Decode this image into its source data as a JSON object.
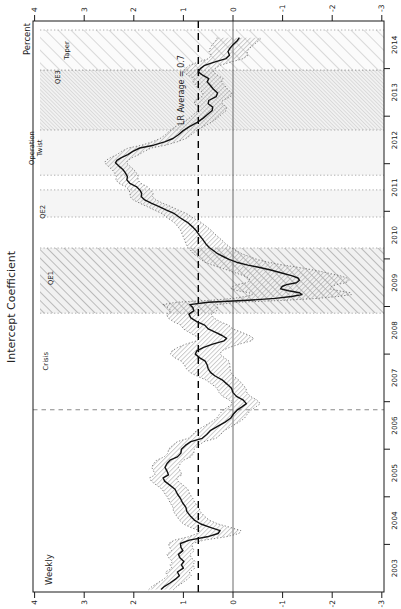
{
  "colors": {
    "line": "#111111",
    "band_edge": "#5f5f5f",
    "band_hatch": "#a0a0a0",
    "zero_line": "#444444",
    "lr_line": "#000000",
    "break_line": "#8a8a8a",
    "frame": "#1a1a1a",
    "text": "#222222",
    "event_edge": "#9a9a9a",
    "qe1_bg": "#f1f1f1",
    "qe1_hatch": "#adadad",
    "qe3_bg": "#f2f2f2",
    "qe3_hatch": "#cbcbcb",
    "taper_bg": "#fbfbfb",
    "taper_hatch": "#c9c9c9",
    "plain_bg": "#f5f5f5"
  },
  "chart_data": {
    "type": "line",
    "title": "Intercept Coefficient",
    "frequency_note": "Weekly",
    "ylabel": "Percent",
    "ylim": [
      -3,
      4
    ],
    "yticks": [
      4,
      3,
      2,
      1,
      0,
      -1,
      -2,
      -3
    ],
    "xlim": [
      2003,
      2015
    ],
    "xtick_years": [
      "2003",
      "2004",
      "2005",
      "2006",
      "2007",
      "2008",
      "2009",
      "2010",
      "2011",
      "2012",
      "2013",
      "2014"
    ],
    "zero_line": 0,
    "lr_average": {
      "value": 0.7,
      "label": "LR Average = 0.7",
      "label_t": 2013.55,
      "label_level": 1.05
    },
    "break_line_t": 2006.83,
    "legend_note": "solid line = posterior mean; dotted hatched band = credible interval",
    "events": [
      {
        "id": "crisis",
        "label": "Crisis",
        "t0": 2006.83,
        "t1": 2008.86,
        "style": "none",
        "label_t": 2007.85,
        "label_depth": 48
      },
      {
        "id": "qe1",
        "label": "QE1",
        "t0": 2008.86,
        "t1": 2010.23,
        "style": "hatch-coarse",
        "label_t": 2009.6,
        "label_depth": 53
      },
      {
        "id": "qe2",
        "label": "QE2",
        "t0": 2010.88,
        "t1": 2011.45,
        "style": "plain",
        "label_t": 2010.99,
        "label_depth": 45
      },
      {
        "id": "twist",
        "label": "Operation Twist",
        "label_lines": [
          "Operation",
          "Twist"
        ],
        "t0": 2011.76,
        "t1": 2012.98,
        "style": "plain",
        "label_t": 2012.33,
        "label_depth": 42
      },
      {
        "id": "qe3",
        "label": "QE3",
        "t0": 2012.71,
        "t1": 2013.97,
        "style": "hatch-fine",
        "label_t": 2013.82,
        "label_depth": 60
      },
      {
        "id": "taper",
        "label": "Taper",
        "t0": 2013.97,
        "t1": 2014.81,
        "style": "hatch-sparse",
        "label_t": 2014.38,
        "label_depth": 69
      }
    ],
    "series": [
      {
        "name": "Intercept coefficient",
        "points": [
          [
            2003.05,
            1.45,
            0.25
          ],
          [
            2003.12,
            1.38,
            0.25
          ],
          [
            2003.19,
            1.27,
            0.25
          ],
          [
            2003.27,
            1.16,
            0.24
          ],
          [
            2003.34,
            1.08,
            0.24
          ],
          [
            2003.42,
            1.12,
            0.24
          ],
          [
            2003.5,
            1.0,
            0.23
          ],
          [
            2003.57,
            1.04,
            0.23
          ],
          [
            2003.64,
            0.99,
            0.23
          ],
          [
            2003.72,
            1.07,
            0.23
          ],
          [
            2003.79,
            1.1,
            0.23
          ],
          [
            2003.87,
            1.01,
            0.23
          ],
          [
            2003.94,
            1.05,
            0.23
          ],
          [
            2004.02,
            1.06,
            0.24
          ],
          [
            2004.09,
            0.88,
            0.3
          ],
          [
            2004.16,
            0.52,
            0.38
          ],
          [
            2004.23,
            0.3,
            0.42
          ],
          [
            2004.29,
            0.26,
            0.42
          ],
          [
            2004.36,
            0.46,
            0.4
          ],
          [
            2004.43,
            0.65,
            0.35
          ],
          [
            2004.51,
            0.78,
            0.3
          ],
          [
            2004.6,
            0.86,
            0.28
          ],
          [
            2004.69,
            0.93,
            0.27
          ],
          [
            2004.78,
            0.95,
            0.26
          ],
          [
            2004.88,
            1.02,
            0.25
          ],
          [
            2004.97,
            1.06,
            0.25
          ],
          [
            2005.06,
            1.12,
            0.25
          ],
          [
            2005.16,
            1.17,
            0.26
          ],
          [
            2005.25,
            1.28,
            0.27
          ],
          [
            2005.33,
            1.38,
            0.27
          ],
          [
            2005.4,
            1.41,
            0.27
          ],
          [
            2005.46,
            1.3,
            0.27
          ],
          [
            2005.54,
            1.33,
            0.27
          ],
          [
            2005.62,
            1.37,
            0.27
          ],
          [
            2005.7,
            1.33,
            0.27
          ],
          [
            2005.77,
            1.27,
            0.27
          ],
          [
            2005.84,
            1.12,
            0.27
          ],
          [
            2005.92,
            1.05,
            0.26
          ],
          [
            2006.0,
            1.04,
            0.26
          ],
          [
            2006.08,
            0.96,
            0.26
          ],
          [
            2006.16,
            0.85,
            0.27
          ],
          [
            2006.23,
            0.62,
            0.28
          ],
          [
            2006.31,
            0.53,
            0.28
          ],
          [
            2006.39,
            0.46,
            0.28
          ],
          [
            2006.48,
            0.31,
            0.28
          ],
          [
            2006.57,
            0.16,
            0.28
          ],
          [
            2006.65,
            0.05,
            0.28
          ],
          [
            2006.74,
            -0.01,
            0.28
          ],
          [
            2006.82,
            -0.08,
            0.28
          ],
          [
            2006.89,
            -0.18,
            0.28
          ],
          [
            2006.96,
            -0.27,
            0.28
          ],
          [
            2007.04,
            -0.2,
            0.28
          ],
          [
            2007.11,
            -0.07,
            0.28
          ],
          [
            2007.19,
            0.0,
            0.28
          ],
          [
            2007.28,
            0.03,
            0.29
          ],
          [
            2007.37,
            0.12,
            0.31
          ],
          [
            2007.46,
            0.22,
            0.33
          ],
          [
            2007.54,
            0.36,
            0.37
          ],
          [
            2007.61,
            0.45,
            0.41
          ],
          [
            2007.69,
            0.5,
            0.44
          ],
          [
            2007.77,
            0.52,
            0.46
          ],
          [
            2007.85,
            0.56,
            0.48
          ],
          [
            2007.92,
            0.67,
            0.5
          ],
          [
            2008.0,
            0.76,
            0.5
          ],
          [
            2008.07,
            0.73,
            0.5
          ],
          [
            2008.14,
            0.59,
            0.52
          ],
          [
            2008.21,
            0.41,
            0.54
          ],
          [
            2008.28,
            0.18,
            0.55
          ],
          [
            2008.33,
            0.13,
            0.55
          ],
          [
            2008.39,
            0.22,
            0.55
          ],
          [
            2008.46,
            0.36,
            0.53
          ],
          [
            2008.53,
            0.5,
            0.5
          ],
          [
            2008.61,
            0.57,
            0.48
          ],
          [
            2008.68,
            0.73,
            0.47
          ],
          [
            2008.76,
            0.85,
            0.46
          ],
          [
            2008.84,
            0.89,
            0.45
          ],
          [
            2008.91,
            0.79,
            0.46
          ],
          [
            2008.98,
            0.81,
            0.5
          ],
          [
            2009.04,
            0.87,
            0.55
          ],
          [
            2009.09,
            0.5,
            0.63
          ],
          [
            2009.13,
            -0.3,
            0.75
          ],
          [
            2009.17,
            -0.85,
            0.85
          ],
          [
            2009.21,
            -1.18,
            0.93
          ],
          [
            2009.25,
            -1.39,
            1.0
          ],
          [
            2009.29,
            -1.34,
            1.02
          ],
          [
            2009.33,
            -1.12,
            1.02
          ],
          [
            2009.37,
            -0.96,
            1.0
          ],
          [
            2009.42,
            -0.99,
            1.0
          ],
          [
            2009.46,
            -1.08,
            1.0
          ],
          [
            2009.5,
            -1.28,
            1.0
          ],
          [
            2009.55,
            -1.34,
            1.0
          ],
          [
            2009.6,
            -1.31,
            0.99
          ],
          [
            2009.65,
            -1.18,
            0.97
          ],
          [
            2009.7,
            -1.0,
            0.93
          ],
          [
            2009.76,
            -0.78,
            0.88
          ],
          [
            2009.82,
            -0.54,
            0.8
          ],
          [
            2009.87,
            -0.3,
            0.72
          ],
          [
            2009.93,
            -0.07,
            0.64
          ],
          [
            2009.99,
            0.08,
            0.57
          ],
          [
            2010.05,
            0.2,
            0.52
          ],
          [
            2010.11,
            0.31,
            0.49
          ],
          [
            2010.17,
            0.39,
            0.46
          ],
          [
            2010.24,
            0.48,
            0.43
          ],
          [
            2010.32,
            0.55,
            0.4
          ],
          [
            2010.41,
            0.61,
            0.37
          ],
          [
            2010.5,
            0.68,
            0.34
          ],
          [
            2010.59,
            0.74,
            0.31
          ],
          [
            2010.68,
            0.82,
            0.29
          ],
          [
            2010.77,
            0.92,
            0.27
          ],
          [
            2010.86,
            1.06,
            0.26
          ],
          [
            2010.95,
            1.18,
            0.25
          ],
          [
            2011.03,
            1.35,
            0.24
          ],
          [
            2011.1,
            1.49,
            0.24
          ],
          [
            2011.17,
            1.65,
            0.23
          ],
          [
            2011.24,
            1.78,
            0.23
          ],
          [
            2011.31,
            1.85,
            0.23
          ],
          [
            2011.38,
            1.84,
            0.23
          ],
          [
            2011.45,
            1.88,
            0.22
          ],
          [
            2011.52,
            1.95,
            0.22
          ],
          [
            2011.59,
            2.08,
            0.22
          ],
          [
            2011.66,
            2.14,
            0.22
          ],
          [
            2011.73,
            2.13,
            0.22
          ],
          [
            2011.81,
            2.17,
            0.22
          ],
          [
            2011.88,
            2.22,
            0.22
          ],
          [
            2011.95,
            2.3,
            0.22
          ],
          [
            2012.02,
            2.37,
            0.22
          ],
          [
            2012.07,
            2.34,
            0.22
          ],
          [
            2012.13,
            2.25,
            0.22
          ],
          [
            2012.19,
            2.12,
            0.22
          ],
          [
            2012.26,
            2.02,
            0.23
          ],
          [
            2012.33,
            1.88,
            0.23
          ],
          [
            2012.39,
            1.6,
            0.24
          ],
          [
            2012.46,
            1.38,
            0.25
          ],
          [
            2012.53,
            1.21,
            0.26
          ],
          [
            2012.61,
            1.1,
            0.26
          ],
          [
            2012.69,
            1.01,
            0.27
          ],
          [
            2012.78,
            0.88,
            0.28
          ],
          [
            2012.87,
            0.72,
            0.28
          ],
          [
            2012.96,
            0.6,
            0.28
          ],
          [
            2013.04,
            0.51,
            0.28
          ],
          [
            2013.12,
            0.42,
            0.28
          ],
          [
            2013.19,
            0.41,
            0.28
          ],
          [
            2013.26,
            0.5,
            0.28
          ],
          [
            2013.33,
            0.49,
            0.28
          ],
          [
            2013.41,
            0.34,
            0.29
          ],
          [
            2013.49,
            0.31,
            0.29
          ],
          [
            2013.57,
            0.4,
            0.29
          ],
          [
            2013.65,
            0.46,
            0.29
          ],
          [
            2013.72,
            0.52,
            0.29
          ],
          [
            2013.79,
            0.49,
            0.29
          ],
          [
            2013.86,
            0.61,
            0.3
          ],
          [
            2013.93,
            0.7,
            0.3
          ],
          [
            2014.0,
            0.66,
            0.3
          ],
          [
            2014.07,
            0.57,
            0.31
          ],
          [
            2014.14,
            0.36,
            0.33
          ],
          [
            2014.21,
            0.14,
            0.35
          ],
          [
            2014.28,
            0.07,
            0.37
          ],
          [
            2014.36,
            0.1,
            0.38
          ],
          [
            2014.43,
            0.06,
            0.4
          ],
          [
            2014.5,
            0.0,
            0.42
          ],
          [
            2014.58,
            -0.08,
            0.43
          ],
          [
            2014.65,
            -0.13,
            0.45
          ]
        ]
      }
    ]
  }
}
